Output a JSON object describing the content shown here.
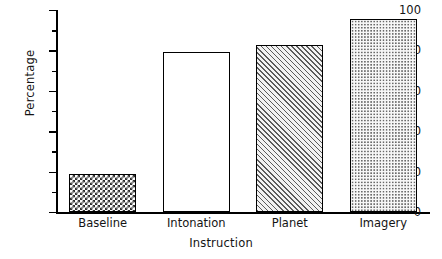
{
  "chart_data": {
    "type": "bar",
    "title": "",
    "xlabel": "Instruction",
    "ylabel": "Percentage",
    "categories": [
      "Baseline",
      "Intonation",
      "Planet",
      "Imagery"
    ],
    "values": [
      19,
      79,
      82.5,
      95.5
    ],
    "ylim": [
      0,
      100
    ],
    "ytick_labels": [
      "0",
      "20",
      "40",
      "60",
      "80",
      "100"
    ],
    "ytick_values": [
      0,
      20,
      40,
      60,
      80,
      100
    ],
    "yminor_tick_values": [
      10,
      30,
      50,
      70,
      90
    ],
    "grid": false,
    "legend": null,
    "bar_fills": [
      "checker",
      "none",
      "diagonal",
      "dots"
    ],
    "bar_edge_color": "#000000",
    "background_color": "#ffffff"
  }
}
